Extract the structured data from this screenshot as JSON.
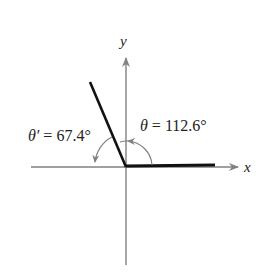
{
  "diagram": {
    "axes": {
      "x_label": "x",
      "y_label": "y"
    },
    "angles": {
      "theta": {
        "symbol": "θ",
        "equals": " = ",
        "value": "112.6°"
      },
      "reference": {
        "symbol": "θ′",
        "equals": " = ",
        "value": "67.4°"
      }
    },
    "colors": {
      "axis": "#808080",
      "terminal_side": "#111111",
      "arc": "#808080",
      "text": "#222222"
    }
  }
}
